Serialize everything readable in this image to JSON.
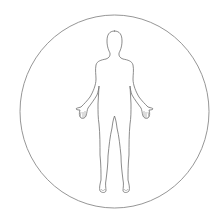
{
  "image": {
    "description": "human-body-outline-in-circle",
    "colors": {
      "background": "#ffffff",
      "circle_stroke": "#8a8a8a",
      "body_stroke": "#6e6e6e"
    }
  }
}
